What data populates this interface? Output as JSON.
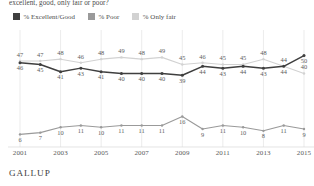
{
  "title": "excellent, good, only fair or poor?",
  "footer": "GALLUP",
  "colors": {
    "excellent_good": "#3f3f3f",
    "poor": "#9a9a9a",
    "only_fair": "#d2d2d2",
    "gridline": "#e2e2e2",
    "text": "#4a4a4a"
  },
  "legend": {
    "items": [
      {
        "label": "% Excellent/Good",
        "color": "#3f3f3f",
        "name": "legend-excellent-good"
      },
      {
        "label": "% Poor",
        "color": "#9a9a9a",
        "name": "legend-poor"
      },
      {
        "label": "% Only fair",
        "color": "#d2d2d2",
        "name": "legend-only-fair"
      }
    ]
  },
  "xaxis": {
    "ticks": [
      "2001",
      "2003",
      "2005",
      "2007",
      "2009",
      "2011",
      "2013",
      "2015"
    ]
  },
  "chart_data": {
    "type": "line",
    "title": "excellent, good, only fair or poor?",
    "xlabel": "",
    "ylabel": "",
    "ylim": [
      0,
      60
    ],
    "grid": true,
    "legend_position": "top-left",
    "x": [
      2001,
      2002,
      2003,
      2004,
      2005,
      2006,
      2007,
      2008,
      2009,
      2010,
      2011,
      2012,
      2013,
      2014,
      2015
    ],
    "categories": [
      "2001",
      "2002",
      "2003",
      "2004",
      "2005",
      "2006",
      "2007",
      "2008",
      "2009",
      "2010",
      "2011",
      "2012",
      "2013",
      "2014",
      "2015"
    ],
    "series": [
      {
        "name": "% Excellent/Good",
        "color": "#3f3f3f",
        "values": [
          46,
          45,
          41,
          43,
          41,
          40,
          40,
          40,
          39,
          44,
          43,
          44,
          43,
          44,
          50
        ],
        "label_position": "below"
      },
      {
        "name": "% Only fair",
        "color": "#d2d2d2",
        "values": [
          47,
          47,
          48,
          46,
          48,
          49,
          48,
          49,
          45,
          46,
          45,
          45,
          48,
          44,
          40
        ],
        "label_position": "above"
      },
      {
        "name": "% Poor",
        "color": "#9a9a9a",
        "values": [
          6,
          7,
          10,
          11,
          10,
          11,
          11,
          11,
          16,
          9,
          11,
          10,
          8,
          11,
          9
        ],
        "label_position": "below"
      }
    ]
  }
}
